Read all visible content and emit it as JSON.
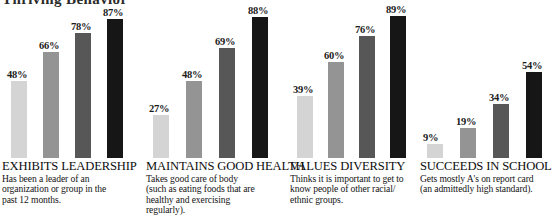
{
  "figure": {
    "clipped_title": "Thriving Behavior",
    "background": "#ffffff"
  },
  "series_colors": [
    "#d4d4d4",
    "#949494",
    "#575757",
    "#161616"
  ],
  "chart_data": {
    "type": "bar",
    "title": "Thriving Behavior",
    "xlabel": "",
    "ylabel": "",
    "ylim": [
      0,
      100
    ],
    "grid": false,
    "legend": "none",
    "value_suffix": "%",
    "categories": [
      "EXHIBITS LEADERSHIP",
      "MAINTAINS GOOD HEALTH",
      "VALUES DIVERSITY",
      "SUCCEEDS IN SCHOOL"
    ],
    "series": [
      {
        "name": "Level 1",
        "color": "#d4d4d4",
        "values": [
          48,
          27,
          39,
          9
        ]
      },
      {
        "name": "Level 2",
        "color": "#949494",
        "values": [
          66,
          48,
          60,
          19
        ]
      },
      {
        "name": "Level 3",
        "color": "#575757",
        "values": [
          78,
          69,
          76,
          34
        ]
      },
      {
        "name": "Level 4",
        "color": "#161616",
        "values": [
          87,
          88,
          89,
          54
        ]
      }
    ]
  },
  "groups": [
    {
      "title": "EXHIBITS LEADERSHIP",
      "description_lines": [
        "Has been a leader of an",
        "organization or group in the",
        "past 12 months."
      ],
      "bars": [
        {
          "value": 48,
          "label": "48%",
          "color": "#d4d4d4"
        },
        {
          "value": 66,
          "label": "66%",
          "color": "#949494"
        },
        {
          "value": 78,
          "label": "78%",
          "color": "#575757"
        },
        {
          "value": 87,
          "label": "87%",
          "color": "#161616"
        }
      ]
    },
    {
      "title": "MAINTAINS GOOD HEALTH",
      "description_lines": [
        "Takes good care of body",
        "(such as eating foods that are",
        "healthy and exercising",
        "regularly)."
      ],
      "bars": [
        {
          "value": 27,
          "label": "27%",
          "color": "#d4d4d4"
        },
        {
          "value": 48,
          "label": "48%",
          "color": "#949494"
        },
        {
          "value": 69,
          "label": "69%",
          "color": "#575757"
        },
        {
          "value": 88,
          "label": "88%",
          "color": "#161616"
        }
      ]
    },
    {
      "title": "VALUES DIVERSITY",
      "description_lines": [
        "Thinks it is important to get to",
        "know people of other racial/",
        "ethnic groups."
      ],
      "bars": [
        {
          "value": 39,
          "label": "39%",
          "color": "#d4d4d4"
        },
        {
          "value": 60,
          "label": "60%",
          "color": "#949494"
        },
        {
          "value": 76,
          "label": "76%",
          "color": "#575757"
        },
        {
          "value": 89,
          "label": "89%",
          "color": "#161616"
        }
      ]
    },
    {
      "title": "SUCCEEDS IN SCHOOL",
      "description_lines": [
        "Gets mostly A's on report card",
        "(an admittedly high standard)."
      ],
      "bars": [
        {
          "value": 9,
          "label": "9%",
          "color": "#d4d4d4"
        },
        {
          "value": 19,
          "label": "19%",
          "color": "#949494"
        },
        {
          "value": 34,
          "label": "34%",
          "color": "#575757"
        },
        {
          "value": 54,
          "label": "54%",
          "color": "#161616"
        }
      ]
    }
  ]
}
